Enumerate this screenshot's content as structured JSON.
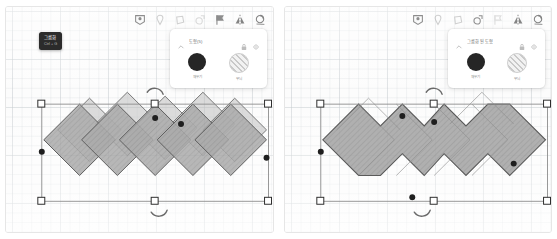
{
  "toolbar": {
    "icons": [
      {
        "name": "badge-icon",
        "label": "배지"
      },
      {
        "name": "pin-icon",
        "label": "핀"
      },
      {
        "name": "shape-icon",
        "label": "도형"
      },
      {
        "name": "duplicate-icon",
        "label": "복제"
      },
      {
        "name": "flag-icon",
        "label": "깃발"
      },
      {
        "name": "flip-horizontal-icon",
        "label": "좌우 반전"
      },
      {
        "name": "rotate-icon",
        "label": "회전"
      }
    ]
  },
  "left_shot": {
    "panel": {
      "title": "도형(5)",
      "lock_icon": "lock-icon",
      "visibility_icon": "eye-icon",
      "collapse_icon": "chevron-up-icon",
      "swatches": [
        {
          "name": "fill-swatch",
          "label": "채우기",
          "color": "#262626"
        },
        {
          "name": "pattern-swatch",
          "label": "무늬",
          "color": "#e8e8e8"
        }
      ]
    },
    "tooltip": {
      "title": "그룹화",
      "shortcut": "Ctrl + G"
    }
  },
  "right_shot": {
    "panel": {
      "title": "그룹화된 도형",
      "lock_icon": "lock-icon",
      "visibility_icon": "eye-icon",
      "collapse_icon": "chevron-up-icon",
      "swatches": [
        {
          "name": "fill-swatch",
          "label": "채우기",
          "color": "#262626"
        },
        {
          "name": "pattern-swatch",
          "label": "무늬",
          "color": "#e8e8e8"
        }
      ]
    }
  },
  "colors": {
    "shape_fill": "#9a9a9a",
    "shape_stroke": "#4a4a4a",
    "handle_fill": "#ffffff",
    "handle_stroke": "#2e2e2e",
    "selection_line": "#7a7a7a",
    "grid": "#c6ccd0",
    "canvas_bg": "#fcfcfc",
    "panel_bg": "#ffffff",
    "tooltip_bg": "#2b2b2b"
  }
}
